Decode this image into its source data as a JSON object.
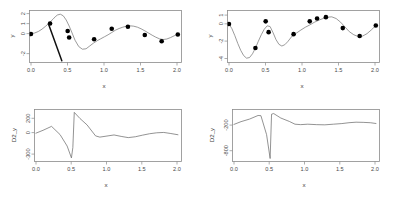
{
  "figure": {
    "panel_count": 4,
    "background": "#ffffff",
    "curve_color": "#7a7a7a",
    "point_color": "#000000",
    "axis_color": "#8b8b8b"
  },
  "panels": {
    "top_left": {
      "name": "y-vs-x-left",
      "xlabel": "x",
      "ylabel": "y",
      "xticks": [
        "0.0",
        "0.5",
        "1.0",
        "1.5",
        "2.0"
      ],
      "yticks": [
        "2",
        "1",
        "0",
        "-2"
      ]
    },
    "top_right": {
      "name": "y-vs-x-right",
      "xlabel": "x",
      "ylabel": "y",
      "xticks": [
        "0.0",
        "0.5",
        "1.0",
        "1.5",
        "2.0"
      ],
      "yticks": [
        "1",
        "0",
        "-2",
        "-4"
      ]
    },
    "bottom_left": {
      "name": "d2y-vs-x-left",
      "xlabel": "x",
      "ylabel": "D2_y",
      "xticks": [
        "0.0",
        "0.5",
        "1.0",
        "1.5",
        "2.0"
      ],
      "yticks": [
        "200",
        "0",
        "-300"
      ]
    },
    "bottom_right": {
      "name": "d2y-vs-x-right",
      "xlabel": "x",
      "ylabel": "D2_y",
      "xticks": [
        "0.0",
        "0.5",
        "1.0",
        "1.5",
        "2.0"
      ],
      "yticks": [
        "-200",
        "-800"
      ]
    }
  },
  "chart_data": [
    {
      "type": "line",
      "name": "top-left",
      "title": "",
      "xlabel": "x",
      "ylabel": "y",
      "xlim": [
        -0.02,
        2.05
      ],
      "ylim": [
        -2.85,
        2.35
      ],
      "xticks": [
        0.0,
        0.5,
        1.0,
        1.5,
        2.0
      ],
      "yticks": [
        2,
        1,
        0,
        -2
      ],
      "grid": false,
      "legend": null,
      "series": [
        {
          "name": "spline-fit",
          "kind": "line",
          "x": [
            0.0,
            0.05,
            0.1,
            0.15,
            0.2,
            0.25,
            0.3,
            0.33,
            0.36,
            0.4,
            0.44,
            0.48,
            0.52,
            0.56,
            0.6,
            0.65,
            0.7,
            0.75,
            0.8,
            0.85,
            0.9,
            0.95,
            1.0,
            1.05,
            1.1,
            1.15,
            1.2,
            1.25,
            1.3,
            1.35,
            1.4,
            1.45,
            1.5,
            1.55,
            1.6,
            1.65,
            1.7,
            1.75,
            1.8,
            1.85,
            1.9,
            1.95,
            2.0
          ],
          "y": [
            0.02,
            0.1,
            0.25,
            0.48,
            0.78,
            1.12,
            1.48,
            1.72,
            1.9,
            1.98,
            1.82,
            1.4,
            0.8,
            0.1,
            -0.62,
            -1.25,
            -1.52,
            -1.48,
            -1.2,
            -0.92,
            -0.68,
            -0.48,
            -0.28,
            -0.08,
            0.15,
            0.38,
            0.55,
            0.68,
            0.78,
            0.82,
            0.78,
            0.68,
            0.52,
            0.32,
            0.1,
            -0.12,
            -0.32,
            -0.48,
            -0.55,
            -0.5,
            -0.36,
            -0.18,
            -0.02
          ]
        },
        {
          "name": "data-points",
          "kind": "scatter",
          "x": [
            0.0,
            0.26,
            0.5,
            0.52,
            0.86,
            1.1,
            1.32,
            1.55,
            1.78,
            2.0
          ],
          "y": [
            0.0,
            1.05,
            0.3,
            -0.35,
            -0.52,
            0.52,
            0.72,
            -0.1,
            -0.72,
            -0.05
          ]
        },
        {
          "name": "artifact-spike",
          "kind": "line",
          "x": [
            0.24,
            0.42
          ],
          "y": [
            0.98,
            -2.68
          ]
        }
      ]
    },
    {
      "type": "line",
      "name": "top-right",
      "title": "",
      "xlabel": "x",
      "ylabel": "y",
      "xlim": [
        -0.02,
        2.05
      ],
      "ylim": [
        -4.45,
        1.55
      ],
      "xticks": [
        0.0,
        0.5,
        1.0,
        1.5,
        2.0
      ],
      "yticks": [
        1,
        0,
        -2,
        -4
      ],
      "grid": false,
      "legend": null,
      "series": [
        {
          "name": "spline-fit",
          "kind": "line",
          "x": [
            0.0,
            0.04,
            0.08,
            0.12,
            0.16,
            0.2,
            0.24,
            0.28,
            0.32,
            0.36,
            0.4,
            0.44,
            0.48,
            0.52,
            0.56,
            0.6,
            0.64,
            0.68,
            0.72,
            0.76,
            0.8,
            0.86,
            0.92,
            0.98,
            1.04,
            1.1,
            1.16,
            1.22,
            1.28,
            1.34,
            1.4,
            1.46,
            1.52,
            1.58,
            1.64,
            1.7,
            1.76,
            1.82,
            1.88,
            1.94,
            2.0
          ],
          "y": [
            0.0,
            -0.55,
            -1.35,
            -2.25,
            -3.05,
            -3.65,
            -3.95,
            -3.88,
            -3.45,
            -2.8,
            -2.0,
            -1.25,
            -0.62,
            -0.22,
            -0.3,
            -1.0,
            -1.8,
            -2.35,
            -2.55,
            -2.4,
            -2.05,
            -1.4,
            -1.05,
            -0.7,
            -0.38,
            -0.12,
            0.18,
            0.42,
            0.62,
            0.78,
            0.82,
            0.62,
            0.2,
            -0.35,
            -0.9,
            -1.25,
            -1.45,
            -1.4,
            -1.12,
            -0.68,
            -0.18
          ]
        },
        {
          "name": "data-points",
          "kind": "scatter",
          "x": [
            0.0,
            0.36,
            0.5,
            0.54,
            0.88,
            1.1,
            1.2,
            1.32,
            1.55,
            1.78,
            2.0
          ],
          "y": [
            0.0,
            -2.78,
            0.3,
            -0.95,
            -1.18,
            0.3,
            0.62,
            0.78,
            -0.48,
            -1.4,
            -0.18
          ]
        }
      ]
    },
    {
      "type": "line",
      "name": "bottom-left",
      "title": "",
      "xlabel": "x",
      "ylabel": "D2_y",
      "xlim": [
        -0.02,
        2.05
      ],
      "ylim": [
        -395,
        330
      ],
      "xticks": [
        0.0,
        0.5,
        1.0,
        1.5,
        2.0
      ],
      "yticks": [
        200,
        0,
        -300
      ],
      "grid": false,
      "legend": null,
      "series": [
        {
          "name": "second-derivative",
          "kind": "line",
          "x": [
            0.0,
            0.1,
            0.22,
            0.34,
            0.44,
            0.5,
            0.52,
            0.54,
            0.62,
            0.72,
            0.84,
            0.9,
            1.0,
            1.1,
            1.2,
            1.3,
            1.4,
            1.5,
            1.6,
            1.7,
            1.8,
            1.9,
            2.0
          ],
          "y": [
            0,
            40,
            95,
            -20,
            -180,
            -345,
            -200,
            290,
            205,
            115,
            -38,
            -55,
            -40,
            -25,
            -45,
            -62,
            -50,
            -28,
            -8,
            5,
            10,
            -5,
            -22
          ]
        }
      ]
    },
    {
      "type": "line",
      "name": "bottom-right",
      "title": "",
      "xlabel": "x",
      "ylabel": "D2_y",
      "xlim": [
        -0.02,
        2.05
      ],
      "ylim": [
        -1050,
        170
      ],
      "xticks": [
        0.0,
        0.5,
        1.0,
        1.5,
        2.0
      ],
      "yticks": [
        -200,
        -800
      ],
      "grid": false,
      "legend": null,
      "series": [
        {
          "name": "second-derivative",
          "kind": "line",
          "x": [
            0.0,
            0.1,
            0.22,
            0.34,
            0.38,
            0.46,
            0.51,
            0.53,
            0.56,
            0.66,
            0.78,
            0.86,
            0.94,
            1.04,
            1.16,
            1.28,
            1.4,
            1.52,
            1.62,
            1.72,
            1.82,
            1.92,
            2.0
          ],
          "y": [
            -180,
            -115,
            -55,
            30,
            25,
            -420,
            -980,
            60,
            75,
            -30,
            -110,
            -175,
            -185,
            -175,
            -185,
            -190,
            -175,
            -160,
            -140,
            -128,
            -132,
            -140,
            -158
          ]
        }
      ]
    }
  ]
}
